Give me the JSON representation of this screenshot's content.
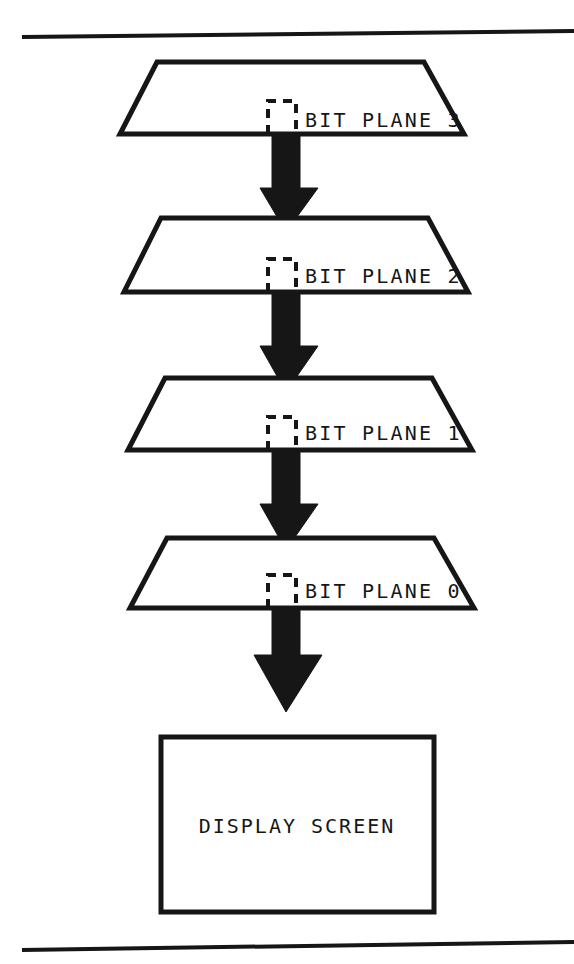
{
  "figure": {
    "background_color": "#ffffff",
    "ink_color": "#161616",
    "width": 574,
    "height": 964
  },
  "rules": {
    "top": {
      "name": "top-rule",
      "x1": 22,
      "y1": 37,
      "x2": 574,
      "y2": 31
    },
    "bottom": {
      "name": "bottom-rule",
      "x1": 22,
      "y1": 950,
      "x2": 574,
      "y2": 942
    }
  },
  "planes": [
    {
      "label": "BIT PLANE 3",
      "label_x": 305,
      "label_y": 127,
      "top_y": 62,
      "bottom_y": 134,
      "top_left_x": 157,
      "top_right_x": 424,
      "bottom_left_x": 120,
      "bottom_right_x": 464,
      "pixel_x": 268,
      "pixel_y": 101,
      "pixel_w": 28,
      "pixel_h": 33
    },
    {
      "label": "BIT PLANE 2",
      "label_x": 305,
      "label_y": 283,
      "top_y": 218,
      "bottom_y": 292,
      "top_left_x": 161,
      "top_right_x": 428,
      "bottom_left_x": 124,
      "bottom_right_x": 468,
      "pixel_x": 268,
      "pixel_y": 259,
      "pixel_w": 28,
      "pixel_h": 33
    },
    {
      "label": "BIT PLANE 1",
      "label_x": 305,
      "label_y": 440,
      "top_y": 378,
      "bottom_y": 450,
      "top_left_x": 165,
      "top_right_x": 432,
      "bottom_left_x": 128,
      "bottom_right_x": 472,
      "pixel_x": 268,
      "pixel_y": 417,
      "pixel_w": 28,
      "pixel_h": 33
    },
    {
      "label": "BIT PLANE 0",
      "label_x": 305,
      "label_y": 598,
      "top_y": 538,
      "bottom_y": 608,
      "top_left_x": 167,
      "top_right_x": 434,
      "bottom_left_x": 130,
      "bottom_right_x": 474,
      "pixel_x": 268,
      "pixel_y": 575,
      "pixel_w": 28,
      "pixel_h": 33
    }
  ],
  "arrows": [
    {
      "name": "arrow-plane3-to-plane2",
      "top_y": 131,
      "tip_y": 232,
      "stem_left": 272,
      "stem_right": 300,
      "head_left": 260,
      "head_right": 318,
      "head_top_y": 188
    },
    {
      "name": "arrow-plane2-to-plane1",
      "top_y": 289,
      "tip_y": 392,
      "stem_left": 272,
      "stem_right": 300,
      "head_left": 260,
      "head_right": 318,
      "head_top_y": 346
    },
    {
      "name": "arrow-plane1-to-plane0",
      "top_y": 447,
      "tip_y": 550,
      "stem_left": 272,
      "stem_right": 300,
      "head_left": 260,
      "head_right": 318,
      "head_top_y": 504
    },
    {
      "name": "arrow-plane0-to-screen",
      "top_y": 605,
      "tip_y": 712,
      "stem_left": 272,
      "stem_right": 300,
      "head_left": 254,
      "head_right": 322,
      "head_top_y": 655
    }
  ],
  "screen": {
    "name": "display-screen",
    "label": "DISPLAY SCREEN",
    "x": 161,
    "y": 737,
    "width": 273,
    "height": 175,
    "label_x": 297,
    "label_y": 833
  }
}
